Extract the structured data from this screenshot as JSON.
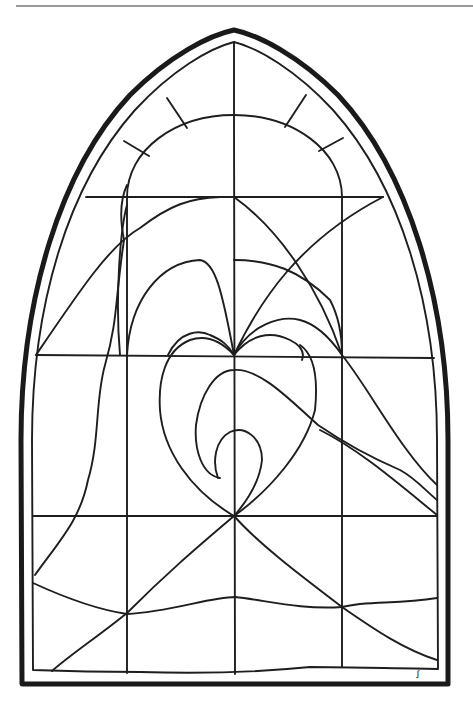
{
  "page": {
    "colors": {
      "background": "#ffffff",
      "line": "#1e1e1e",
      "rule": "#9a9a9a"
    }
  },
  "drawing": {
    "frame": "pointed-gothic-arch",
    "grid": {
      "columns": 4,
      "rows": 3,
      "verticals_x": [
        127,
        234,
        342
      ],
      "horizontals_y": [
        197,
        355,
        516
      ]
    },
    "motif": "heart with inner spiral",
    "signature": "ꭍ"
  }
}
